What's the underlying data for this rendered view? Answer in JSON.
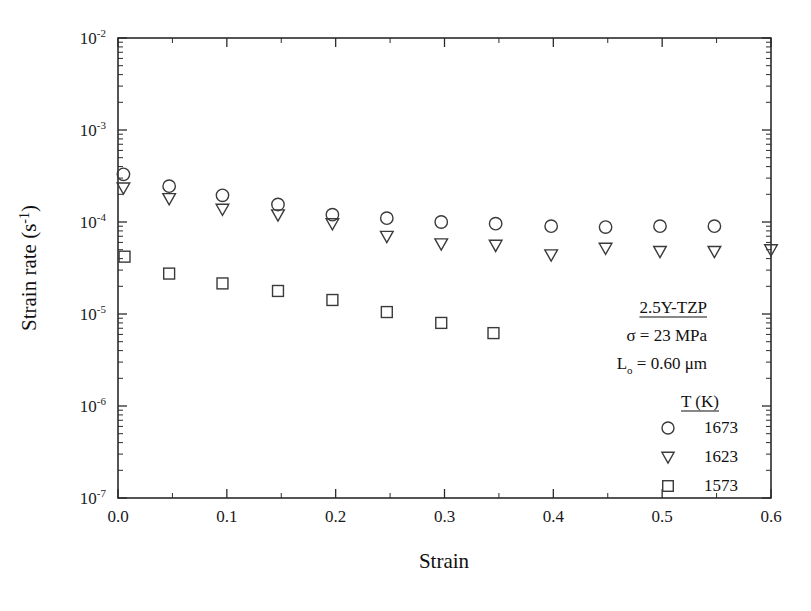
{
  "chart_data": {
    "type": "scatter",
    "title": "",
    "xlabel": "Strain",
    "ylabel": "Strain rate (s⁻¹)",
    "xlim": [
      0.0,
      0.6
    ],
    "ylim": [
      1e-07,
      0.01
    ],
    "yscale": "log",
    "xscale": "linear",
    "grid": false,
    "legend_position": "lower-right",
    "xticks": [
      "0.0",
      "0.1",
      "0.2",
      "0.3",
      "0.4",
      "0.5",
      "0.6"
    ],
    "xtick_values": [
      0.0,
      0.1,
      0.2,
      0.3,
      0.4,
      0.5,
      0.6
    ],
    "yticks": [
      "10-2",
      "10-3",
      "10-4",
      "10-5",
      "10-6",
      "10-7"
    ],
    "ytick_values": [
      0.01,
      0.001,
      0.0001,
      1e-05,
      1e-06,
      1e-07
    ],
    "ytick_mantissa": "10",
    "ytick_exponents": [
      "-2",
      "-3",
      "-4",
      "-5",
      "-6",
      "-7"
    ],
    "series": [
      {
        "name": "1673",
        "legend_label": "1673",
        "marker": "circle",
        "points": [
          {
            "x": 0.005,
            "y": 0.00033
          },
          {
            "x": 0.047,
            "y": 0.000245
          },
          {
            "x": 0.096,
            "y": 0.000195
          },
          {
            "x": 0.147,
            "y": 0.000155
          },
          {
            "x": 0.197,
            "y": 0.00012
          },
          {
            "x": 0.247,
            "y": 0.00011
          },
          {
            "x": 0.297,
            "y": 0.0001
          },
          {
            "x": 0.347,
            "y": 9.6e-05
          },
          {
            "x": 0.398,
            "y": 9e-05
          },
          {
            "x": 0.448,
            "y": 8.8e-05
          },
          {
            "x": 0.498,
            "y": 9e-05
          },
          {
            "x": 0.548,
            "y": 9e-05
          }
        ]
      },
      {
        "name": "1623",
        "legend_label": "1623",
        "marker": "triangle-down",
        "points": [
          {
            "x": 0.005,
            "y": 0.000235
          },
          {
            "x": 0.047,
            "y": 0.00018
          },
          {
            "x": 0.096,
            "y": 0.000138
          },
          {
            "x": 0.147,
            "y": 0.00012
          },
          {
            "x": 0.197,
            "y": 9.6e-05
          },
          {
            "x": 0.247,
            "y": 7e-05
          },
          {
            "x": 0.297,
            "y": 5.8e-05
          },
          {
            "x": 0.347,
            "y": 5.6e-05
          },
          {
            "x": 0.398,
            "y": 4.4e-05
          },
          {
            "x": 0.448,
            "y": 5.2e-05
          },
          {
            "x": 0.498,
            "y": 4.8e-05
          },
          {
            "x": 0.548,
            "y": 4.8e-05
          },
          {
            "x": 0.6,
            "y": 5e-05
          }
        ]
      },
      {
        "name": "1573",
        "legend_label": "1573",
        "marker": "square",
        "points": [
          {
            "x": 0.006,
            "y": 4.2e-05
          },
          {
            "x": 0.047,
            "y": 2.75e-05
          },
          {
            "x": 0.096,
            "y": 2.15e-05
          },
          {
            "x": 0.147,
            "y": 1.78e-05
          },
          {
            "x": 0.197,
            "y": 1.42e-05
          },
          {
            "x": 0.247,
            "y": 1.05e-05
          },
          {
            "x": 0.297,
            "y": 8e-06
          },
          {
            "x": 0.345,
            "y": 6.2e-06
          }
        ]
      }
    ],
    "annotations": [
      {
        "text": "2.5Y-TZP",
        "underline": true
      },
      {
        "text": "σ = 23 MPa",
        "underline": false
      },
      {
        "text": "L",
        "sub": "o",
        "rest": " = 0.60 μm",
        "underline": false
      }
    ]
  },
  "legend": {
    "header": "T (K)",
    "header_underline": true,
    "entries": [
      {
        "marker": "circle",
        "label": "1673"
      },
      {
        "marker": "triangle-down",
        "label": "1623"
      },
      {
        "marker": "square",
        "label": "1573"
      }
    ]
  },
  "annotation_block": {
    "material": "2.5Y-TZP",
    "stress": "σ = 23 MPa",
    "grain_prefix": "L",
    "grain_sub": "o",
    "grain_rest": " = 0.60 μm"
  },
  "axes": {
    "x_title": "Strain",
    "y_title_main": "Strain rate (s",
    "y_title_sup": "-1",
    "y_title_end": ")"
  },
  "colors": {
    "axis": "#2b2b2b",
    "marker": "#3a3a3a",
    "text": "#111111",
    "background": "#ffffff"
  }
}
